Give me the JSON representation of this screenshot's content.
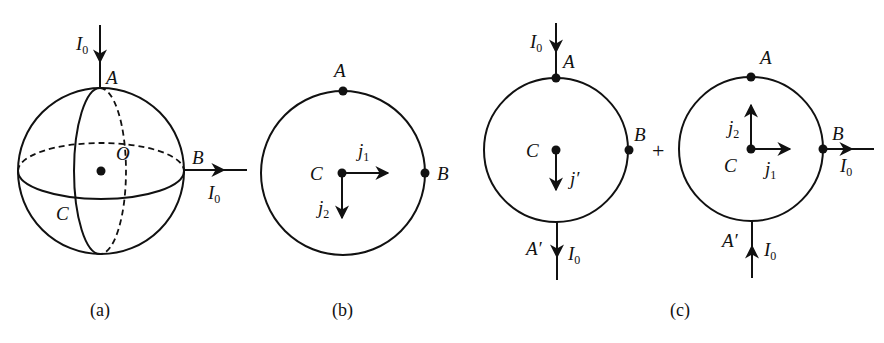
{
  "figure": {
    "panels": [
      {
        "id": "a",
        "caption": "(a)",
        "type": "sphere",
        "center_label": "O",
        "points": {
          "A": "A",
          "B": "B",
          "C": "C"
        },
        "current_in": {
          "label": "I",
          "sub": "0",
          "at": "A",
          "direction": "down"
        },
        "current_out": {
          "label": "I",
          "sub": "0",
          "at": "B",
          "direction": "right"
        }
      },
      {
        "id": "b",
        "caption": "(b)",
        "type": "circle",
        "points": {
          "A": "A",
          "B": "B",
          "C": "C"
        },
        "vectors": [
          {
            "label": "j",
            "sub": "1",
            "direction": "right"
          },
          {
            "label": "j",
            "sub": "2",
            "direction": "down"
          }
        ]
      },
      {
        "id": "c",
        "caption": "(c)",
        "operator": "+",
        "left": {
          "type": "circle",
          "points": {
            "A": "A",
            "B": "B",
            "C": "C",
            "A_prime": "A′"
          },
          "current_in": {
            "label": "I",
            "sub": "0",
            "at": "A",
            "direction": "down"
          },
          "current_out": {
            "label": "I",
            "sub": "0",
            "at": "A′",
            "direction": "down"
          },
          "vectors": [
            {
              "label": "j′",
              "direction": "down"
            }
          ]
        },
        "right": {
          "type": "circle",
          "points": {
            "A": "A",
            "B": "B",
            "C": "C",
            "A_prime": "A′"
          },
          "current_in": {
            "label": "I",
            "sub": "0",
            "at": "A′",
            "direction": "up"
          },
          "current_out": {
            "label": "I",
            "sub": "0",
            "at": "B",
            "direction": "right"
          },
          "vectors": [
            {
              "label": "j",
              "sub": "1",
              "direction": "right"
            },
            {
              "label": "j",
              "sub": "2",
              "direction": "up"
            }
          ]
        }
      }
    ]
  }
}
